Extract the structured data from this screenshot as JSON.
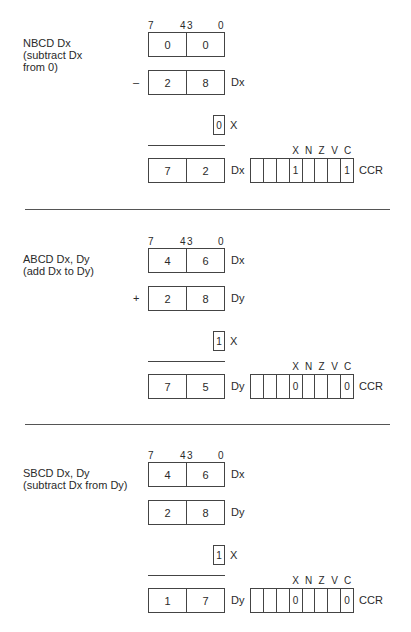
{
  "bit_labels": {
    "b7": "7",
    "b4": "4",
    "b3": "3",
    "b0": "0"
  },
  "ccr": {
    "flags": [
      "X",
      "N",
      "Z",
      "V",
      "C"
    ],
    "name": "CCR"
  },
  "x_label": "X",
  "sections": [
    {
      "instruction": "NBCD Dx\n(subtract Dx\nfrom 0)",
      "operand1": {
        "high": "0",
        "low": "0",
        "name": ""
      },
      "operator": "–",
      "operand2": {
        "high": "2",
        "low": "8",
        "name": "Dx"
      },
      "x_in": "0",
      "result": {
        "high": "7",
        "low": "2",
        "name": "Dx"
      },
      "ccr_cells": [
        "",
        "",
        "",
        "1",
        "",
        "",
        "",
        "1"
      ]
    },
    {
      "instruction": "ABCD Dx, Dy\n(add Dx to Dy)",
      "operand1": {
        "high": "4",
        "low": "6",
        "name": "Dx"
      },
      "operator": "+",
      "operand2": {
        "high": "2",
        "low": "8",
        "name": "Dy"
      },
      "x_in": "1",
      "result": {
        "high": "7",
        "low": "5",
        "name": "Dy"
      },
      "ccr_cells": [
        "",
        "",
        "",
        "0",
        "",
        "",
        "",
        "0"
      ]
    },
    {
      "instruction": "SBCD Dx, Dy\n(subtract Dx from Dy)",
      "operand1": {
        "high": "4",
        "low": "6",
        "name": "Dx"
      },
      "operator": "",
      "operand2": {
        "high": "2",
        "low": "8",
        "name": "Dy"
      },
      "x_in": "1",
      "result": {
        "high": "1",
        "low": "7",
        "name": "Dy"
      },
      "ccr_cells": [
        "",
        "",
        "",
        "0",
        "",
        "",
        "",
        "0"
      ]
    }
  ]
}
